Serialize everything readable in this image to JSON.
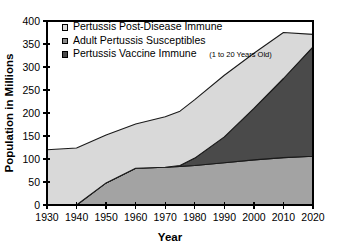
{
  "chart_data": {
    "type": "area",
    "title": "",
    "xlabel": "Year",
    "ylabel": "Population in Millions",
    "xlim": [
      1930,
      2020
    ],
    "ylim": [
      0,
      400
    ],
    "ytick_step": 50,
    "xtick_step": 10,
    "grid": false,
    "stacked": true,
    "legend_position": "top-left-inside",
    "x": [
      1930,
      1940,
      1950,
      1960,
      1970,
      1975,
      1980,
      1990,
      2000,
      2010,
      2020
    ],
    "xticks": [
      "1930",
      "1940",
      "1950",
      "1960",
      "1970",
      "1980",
      "1990",
      "2000",
      "2010",
      "2020"
    ],
    "yticks": [
      "0",
      "50",
      "100",
      "150",
      "200",
      "250",
      "300",
      "350",
      "400"
    ],
    "series": [
      {
        "name": "Pertussis Vaccine Immune",
        "note": "(1 to 20 Years Old)",
        "color": "#a3a3a3",
        "stack_order": 1,
        "values": [
          0,
          0,
          48,
          80,
          82,
          84,
          86,
          92,
          98,
          103,
          106
        ]
      },
      {
        "name": "Adult Pertussis Susceptibles",
        "note": "",
        "color": "#4a4a4a",
        "stack_order": 2,
        "values": [
          0,
          0,
          0,
          0,
          0,
          2,
          16,
          56,
          112,
          172,
          238
        ]
      },
      {
        "name": "Pertussis Post-Disease Immune",
        "note": "",
        "color": "#d9d9d9",
        "stack_order": 3,
        "values": [
          120,
          124,
          104,
          96,
          110,
          118,
          127,
          134,
          120,
          100,
          27
        ]
      }
    ],
    "totals": [
      120,
      124,
      152,
      176,
      192,
      204,
      229,
      282,
      330,
      375,
      371
    ]
  },
  "legend": {
    "items": [
      {
        "label": "Pertussis Post-Disease Immune",
        "note": "",
        "color": "#d9d9d9"
      },
      {
        "label": "Adult Pertussis Susceptibles",
        "note": "",
        "color": "#8a8a8a"
      },
      {
        "label": "Pertussis Vaccine Immune",
        "note": "(1 to 20 Years Old)",
        "color": "#4a4a4a"
      }
    ]
  },
  "axes": {
    "y_title": "Population in Millions",
    "x_title": "Year",
    "y_labels": [
      "400",
      "350",
      "300",
      "250",
      "200",
      "150",
      "100",
      "50",
      "0"
    ],
    "x_labels": [
      "1930",
      "1940",
      "1950",
      "1960",
      "1970",
      "1980",
      "1990",
      "2000",
      "2010",
      "2020"
    ]
  }
}
